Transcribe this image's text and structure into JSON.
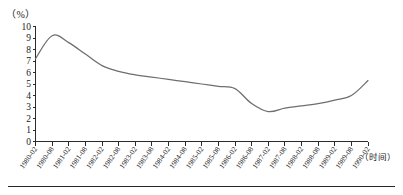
{
  "figure": {
    "y_unit_label": "（%）",
    "x_unit_label": "（时间）",
    "line_color": "#6e6e6e",
    "axis_color": "#2b2b2b"
  },
  "chart_data": {
    "type": "line",
    "title": "",
    "xlabel": "（时间）",
    "ylabel": "（%）",
    "ylim": [
      0,
      10
    ],
    "grid": false,
    "legend": null,
    "yticks": [
      0,
      1,
      2,
      3,
      4,
      5,
      6,
      7,
      8,
      9,
      10
    ],
    "categories": [
      "1980-02",
      "1980-08",
      "1981-02",
      "1981-08",
      "1982-02",
      "1982-08",
      "1983-02",
      "1983-08",
      "1984-02",
      "1984-08",
      "1985-02",
      "1985-08",
      "1986-02",
      "1986-08",
      "1987-02",
      "1987-08",
      "1988-02",
      "1988-08",
      "1989-02",
      "1989-08",
      "1990-02"
    ],
    "values": [
      7.2,
      9.2,
      8.6,
      7.6,
      6.6,
      6.1,
      5.8,
      5.6,
      5.4,
      5.2,
      5.0,
      4.8,
      4.6,
      3.3,
      2.6,
      2.9,
      3.1,
      3.3,
      3.6,
      4.0,
      5.3
    ],
    "series": [
      {
        "name": "",
        "values": [
          7.2,
          9.2,
          8.6,
          7.6,
          6.6,
          6.1,
          5.8,
          5.6,
          5.4,
          5.2,
          5.0,
          4.8,
          4.6,
          3.3,
          2.6,
          2.9,
          3.1,
          3.3,
          3.6,
          4.0,
          5.3
        ]
      }
    ]
  }
}
